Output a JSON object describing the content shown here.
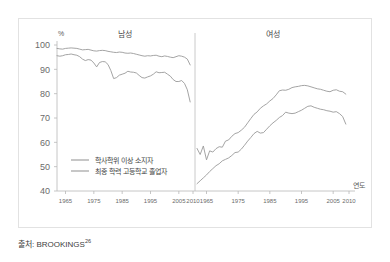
{
  "source_caption": {
    "prefix": "●자: BROOKINGS",
    "text": "출처: BROOKINGS",
    "superscript": "26"
  },
  "axis": {
    "y_unit": "%",
    "x_name": "연도",
    "y_ticks": [
      "100",
      "90",
      "80",
      "70",
      "60",
      "50",
      "40"
    ],
    "x_ticks_left": [
      "1965",
      "1975",
      "1985",
      "1995",
      "2005",
      "2010"
    ],
    "x_ticks_right": [
      "1965",
      "1975",
      "1985",
      "1995",
      "2005",
      "2010"
    ]
  },
  "panels": {
    "left_title": "남성",
    "right_title": "여성"
  },
  "legend": {
    "items": [
      {
        "label": "학사학위 이상 소지자",
        "color": "#9a9a9a"
      },
      {
        "label": "최종 학력 고등학교 졸업자",
        "color": "#9a9a9a"
      }
    ]
  },
  "chart_data": {
    "type": "line",
    "title": "",
    "xlabel": "연도",
    "ylabel": "%",
    "ylim": [
      40,
      100
    ],
    "xlim": [
      1962,
      2010
    ],
    "grid": false,
    "legend_position": "inside-lower-left",
    "panels": [
      {
        "name": "남성",
        "x": [
          1962,
          1963,
          1964,
          1965,
          1966,
          1967,
          1968,
          1969,
          1970,
          1971,
          1972,
          1973,
          1974,
          1975,
          1976,
          1977,
          1978,
          1979,
          1980,
          1981,
          1982,
          1983,
          1984,
          1985,
          1986,
          1987,
          1988,
          1989,
          1990,
          1991,
          1992,
          1993,
          1994,
          1995,
          1996,
          1997,
          1998,
          1999,
          2000,
          2001,
          2002,
          2003,
          2004,
          2005,
          2006,
          2007,
          2008,
          2009
        ],
        "series": [
          {
            "name": "학사학위 이상 소지자",
            "color": "#9a9a9a",
            "values": [
              98.6,
              98.4,
              98.3,
              98.6,
              98.7,
              98.8,
              98.7,
              98.6,
              98.3,
              98.0,
              98.1,
              98.2,
              97.9,
              97.6,
              97.5,
              97.7,
              97.8,
              97.7,
              97.4,
              97.2,
              97.0,
              96.9,
              97.1,
              97.0,
              96.7,
              96.6,
              96.7,
              96.5,
              96.2,
              95.9,
              95.6,
              95.4,
              95.6,
              95.5,
              95.7,
              95.8,
              95.4,
              95.2,
              95.5,
              95.3,
              95.0,
              94.8,
              95.2,
              95.6,
              95.4,
              95.0,
              94.2,
              91.8
            ]
          },
          {
            "name": "최종 학력 고등학교 졸업자",
            "color": "#9a9a9a",
            "values": [
              95.6,
              95.4,
              95.6,
              96.0,
              96.1,
              96.3,
              96.0,
              95.8,
              95.2,
              94.2,
              93.6,
              94.0,
              93.8,
              92.6,
              91.0,
              92.8,
              93.2,
              93.1,
              92.0,
              89.5,
              86.2,
              86.6,
              87.6,
              88.0,
              88.4,
              89.2,
              88.9,
              88.8,
              88.5,
              87.5,
              86.6,
              86.4,
              86.9,
              87.3,
              88.0,
              89.0,
              88.6,
              88.7,
              88.8,
              88.0,
              87.2,
              85.8,
              85.0,
              85.0,
              85.4,
              84.2,
              81.6,
              76.6
            ]
          }
        ]
      },
      {
        "name": "여성",
        "x": [
          1962,
          1963,
          1964,
          1965,
          1966,
          1967,
          1968,
          1969,
          1970,
          1971,
          1972,
          1973,
          1974,
          1975,
          1976,
          1977,
          1978,
          1979,
          1980,
          1981,
          1982,
          1983,
          1984,
          1985,
          1986,
          1987,
          1988,
          1989,
          1990,
          1991,
          1992,
          1993,
          1994,
          1995,
          1996,
          1997,
          1998,
          1999,
          2000,
          2001,
          2002,
          2003,
          2004,
          2005,
          2006,
          2007,
          2008,
          2009
        ],
        "series": [
          {
            "name": "학사학위 이상 소지자",
            "color": "#9a9a9a",
            "values": [
              57.5,
              55.0,
              58.5,
              52.8,
              56.5,
              56.0,
              57.4,
              58.2,
              58.0,
              60.5,
              61.0,
              62.5,
              63.6,
              64.0,
              65.0,
              66.2,
              68.0,
              69.8,
              71.5,
              72.5,
              74.0,
              75.0,
              75.8,
              77.0,
              78.0,
              79.5,
              81.2,
              81.5,
              81.4,
              81.8,
              82.5,
              82.8,
              83.0,
              83.3,
              83.4,
              83.2,
              82.8,
              82.4,
              82.0,
              81.8,
              81.4,
              81.0,
              80.8,
              81.4,
              81.6,
              81.0,
              80.8,
              79.8
            ]
          },
          {
            "name": "최종 학력 고등학교 졸업자",
            "color": "#9a9a9a",
            "values": [
              43.0,
              44.2,
              45.4,
              46.6,
              48.0,
              49.2,
              50.4,
              51.2,
              52.4,
              53.0,
              53.6,
              54.6,
              55.8,
              56.0,
              57.2,
              58.8,
              60.5,
              62.0,
              63.6,
              64.5,
              63.8,
              64.0,
              65.4,
              66.8,
              68.0,
              69.0,
              70.2,
              71.0,
              72.4,
              72.0,
              71.8,
              72.0,
              72.6,
              73.2,
              74.0,
              74.8,
              75.0,
              74.4,
              74.0,
              73.6,
              73.4,
              73.0,
              72.8,
              72.4,
              72.6,
              71.8,
              70.6,
              67.5
            ]
          }
        ]
      }
    ]
  }
}
